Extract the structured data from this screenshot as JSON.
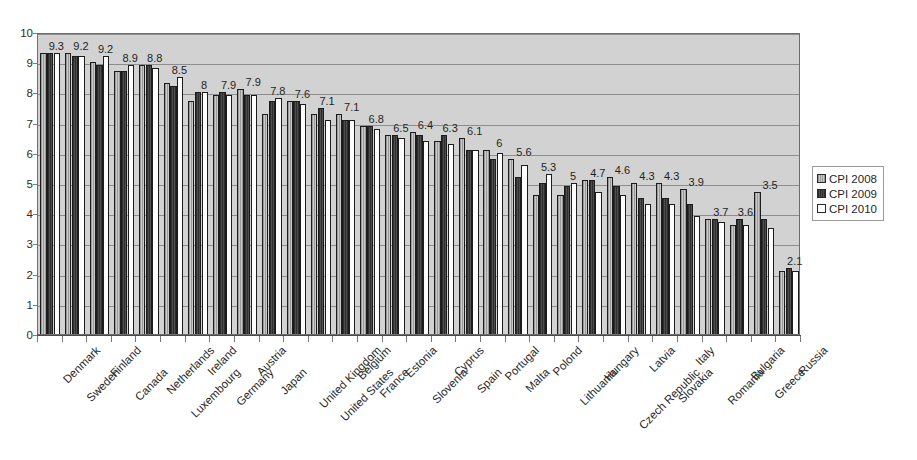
{
  "chart_data": {
    "type": "bar",
    "title": "",
    "subtitle": "",
    "xlabel": "",
    "ylabel": "",
    "ylim": [
      0,
      10
    ],
    "ytick_labels": [
      "10",
      "9",
      "8",
      "7",
      "6",
      "5",
      "4",
      "3",
      "2",
      "1",
      "0"
    ],
    "ytick_values": [
      10,
      9,
      8,
      7,
      6,
      5,
      4,
      3,
      2,
      1,
      0
    ],
    "grid": true,
    "legend_position": "right",
    "categories": [
      "Denmark",
      "Sweden",
      "Finland",
      "Canada",
      "Netherlands",
      "Luxembourg",
      "Ireland",
      "Germany",
      "Austria",
      "Japan",
      "United Kingdom",
      "United States",
      "Belgium",
      "France",
      "Estonia",
      "Slovenia",
      "Cyprus",
      "Spain",
      "Portugal",
      "Malta",
      "Polond",
      "Lithuania",
      "Hungary",
      "Czech Republic",
      "Latvia",
      "Slovakia",
      "Italy",
      "Romania",
      "Bulgaria",
      "Greece",
      "Russia"
    ],
    "series": [
      {
        "name": "CPI 2008",
        "color": "#a9a9a9",
        "values": [
          9.3,
          9.3,
          9.0,
          8.7,
          8.9,
          8.3,
          7.7,
          7.9,
          8.1,
          7.3,
          7.7,
          7.3,
          7.3,
          6.9,
          6.6,
          6.7,
          6.4,
          6.5,
          6.1,
          5.8,
          4.6,
          4.6,
          5.1,
          5.2,
          5.0,
          5.0,
          4.8,
          3.8,
          3.6,
          4.7,
          2.1
        ]
      },
      {
        "name": "CPI 2009",
        "color": "#3a3a3a",
        "values": [
          9.3,
          9.2,
          8.9,
          8.7,
          8.9,
          8.2,
          8.0,
          8.0,
          7.9,
          7.7,
          7.7,
          7.5,
          7.1,
          6.9,
          6.6,
          6.6,
          6.6,
          6.1,
          5.8,
          5.2,
          5.0,
          4.9,
          5.1,
          4.9,
          4.5,
          4.5,
          4.3,
          3.8,
          3.8,
          3.8,
          2.2
        ]
      },
      {
        "name": "CPI 2010",
        "color": "#ffffff",
        "values": [
          9.3,
          9.2,
          9.2,
          8.9,
          8.8,
          8.5,
          8.0,
          7.9,
          7.9,
          7.8,
          7.6,
          7.1,
          7.1,
          6.8,
          6.5,
          6.4,
          6.3,
          6.1,
          6.0,
          5.6,
          5.3,
          5.0,
          4.7,
          4.6,
          4.3,
          4.3,
          3.9,
          3.7,
          3.6,
          3.5,
          2.1
        ]
      }
    ],
    "data_labels": [
      "9.3",
      "9.2",
      "9.2",
      "8.9",
      "8.8",
      "8.5",
      "8",
      "7.9",
      "7.9",
      "7.8",
      "7.6",
      "7.1",
      "7.1",
      "6.8",
      "6.5",
      "6.4",
      "6.3",
      "6.1",
      "6",
      "5.6",
      "5.3",
      "5",
      "4.7",
      "4.6",
      "4.3",
      "4.3",
      "3.9",
      "3.7",
      "3.6",
      "3.5",
      "2.1"
    ],
    "data_label_note": "One value label per country group, annotating the CPI 2010 series"
  },
  "legend": {
    "items": [
      {
        "label": "CPI 2008",
        "swatch": "s2008"
      },
      {
        "label": "CPI 2009",
        "swatch": "s2009"
      },
      {
        "label": "CPI 2010",
        "swatch": "s2010"
      }
    ]
  }
}
